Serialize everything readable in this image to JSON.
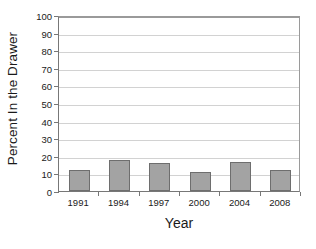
{
  "chart_data": {
    "type": "bar",
    "title": "",
    "subtitle": "",
    "xlabel": "Year",
    "ylabel": "Percent In the Drawer",
    "categories": [
      "1991",
      "1994",
      "1997",
      "2000",
      "2004",
      "2008"
    ],
    "values": [
      12,
      17.5,
      16,
      11,
      16.5,
      12
    ],
    "series": [
      {
        "name": "Percent In the Drawer",
        "values": [
          12,
          17.5,
          16,
          11,
          16.5,
          12
        ]
      }
    ],
    "ylim": [
      0,
      100
    ],
    "ytick_labels": [
      "0",
      "10",
      "20",
      "30",
      "40",
      "50",
      "60",
      "70",
      "80",
      "90",
      "100"
    ],
    "ytick_values": [
      0,
      10,
      20,
      30,
      40,
      50,
      60,
      70,
      80,
      90,
      100
    ],
    "grid": "horizontal",
    "legend": "none",
    "annotations": [],
    "colors": {
      "bar_fill": "#a3a3a3",
      "bar_border": "#6e6e6e",
      "gridline": "#d2d2d2",
      "axis": "#777777",
      "text": "#1a1a1a",
      "background": "#ffffff"
    }
  }
}
